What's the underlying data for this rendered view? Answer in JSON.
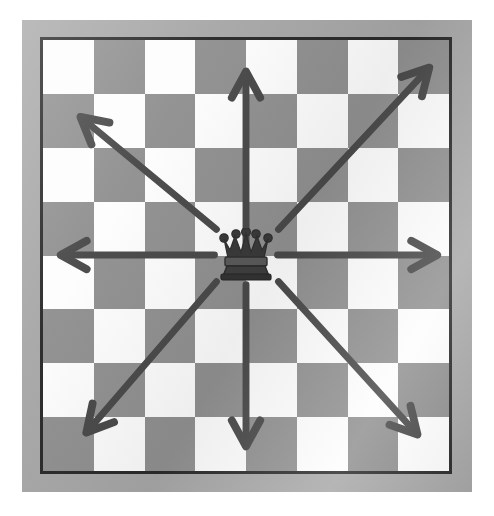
{
  "diagram": {
    "board": {
      "files": 8,
      "ranks": 8,
      "top_left_square": "light",
      "light_square_color": "#fdfdfd",
      "dark_square_color": "#919191",
      "border_color": "#2b2b2b",
      "frame_color": "#a8a8a8",
      "background_color": "#ffffff"
    },
    "piece": {
      "name": "queen",
      "glyph": "♛",
      "color": "#3a3a3a",
      "position_file": 4,
      "position_rank": 4,
      "label": "Queen"
    },
    "arrow_style": {
      "color": "#4a4a4a",
      "shaft_width": 7,
      "head_style": "open-chevron",
      "head_length": 30
    },
    "arrows": [
      {
        "name": "arrow-up",
        "direction": "up",
        "label": "Up",
        "angle_deg": 90,
        "from": [
          206,
          218
        ],
        "to": [
          206,
          32
        ]
      },
      {
        "name": "arrow-up-right",
        "direction": "up-right",
        "label": "Up-right",
        "angle_deg": 45,
        "from": [
          239,
          192
        ],
        "to": [
          392,
          28
        ]
      },
      {
        "name": "arrow-right",
        "direction": "right",
        "label": "Right",
        "angle_deg": 0,
        "from": [
          238,
          218
        ],
        "to": [
          400,
          218
        ]
      },
      {
        "name": "arrow-down-right",
        "direction": "down-right",
        "label": "Down-right",
        "angle_deg": -45,
        "from": [
          239,
          245
        ],
        "to": [
          380,
          400
        ]
      },
      {
        "name": "arrow-down",
        "direction": "down",
        "label": "Down",
        "angle_deg": -90,
        "from": [
          206,
          248
        ],
        "to": [
          206,
          412
        ]
      },
      {
        "name": "arrow-down-left",
        "direction": "down-left",
        "label": "Down-left",
        "angle_deg": -135,
        "from": [
          176,
          245
        ],
        "to": [
          44,
          398
        ]
      },
      {
        "name": "arrow-left",
        "direction": "left",
        "label": "Left",
        "angle_deg": 180,
        "from": [
          174,
          218
        ],
        "to": [
          18,
          218
        ]
      },
      {
        "name": "arrow-up-left",
        "direction": "up-left",
        "label": "Up-left",
        "angle_deg": 135,
        "from": [
          176,
          192
        ],
        "to": [
          38,
          78
        ]
      }
    ],
    "squares": [
      [
        "light",
        "dark",
        "light",
        "dark",
        "light",
        "dark",
        "light",
        "dark"
      ],
      [
        "dark",
        "light",
        "dark",
        "light",
        "dark",
        "light",
        "dark",
        "light"
      ],
      [
        "light",
        "dark",
        "light",
        "dark",
        "light",
        "dark",
        "light",
        "dark"
      ],
      [
        "dark",
        "light",
        "dark",
        "light",
        "dark",
        "light",
        "dark",
        "light"
      ],
      [
        "light",
        "dark",
        "light",
        "dark",
        "light",
        "dark",
        "light",
        "dark"
      ],
      [
        "dark",
        "light",
        "dark",
        "light",
        "dark",
        "light",
        "dark",
        "light"
      ],
      [
        "light",
        "dark",
        "light",
        "dark",
        "light",
        "dark",
        "light",
        "dark"
      ],
      [
        "dark",
        "light",
        "dark",
        "light",
        "dark",
        "light",
        "dark",
        "light"
      ]
    ]
  }
}
